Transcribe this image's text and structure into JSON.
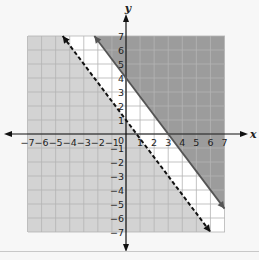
{
  "chart_data": {
    "type": "line",
    "title": "",
    "xlabel": "x",
    "ylabel": "y",
    "xlim": [
      -7,
      7
    ],
    "ylim": [
      -7,
      7
    ],
    "grid": true,
    "x_ticks": [
      -7,
      -6,
      -5,
      -4,
      -3,
      -2,
      -1,
      1,
      2,
      3,
      4,
      5,
      6,
      7
    ],
    "y_ticks": [
      7,
      6,
      5,
      4,
      3,
      2,
      1,
      -1,
      -2,
      -3,
      -4,
      -5,
      -6,
      -7
    ],
    "origin_label": "0",
    "series": [
      {
        "name": "solid boundary",
        "equation": "y = -4/3 x + 4",
        "style": "solid",
        "points": [
          [
            -2.25,
            7
          ],
          [
            7,
            -5.33
          ]
        ],
        "shading": "above",
        "fill_color": "#9c9c9c"
      },
      {
        "name": "dashed boundary",
        "equation": "y = -4/3 x + 1",
        "style": "dashed",
        "points": [
          [
            -4.5,
            7
          ],
          [
            6,
            -7
          ]
        ],
        "shading": "below",
        "fill_color": "#d3d3d3"
      }
    ],
    "colors": {
      "between_region": "#ffffff",
      "solid_line": "#555555",
      "dashed_line": "#111111",
      "grid_light": "#b4b4b4",
      "grid_dark": "#b0b0b0",
      "axis": "#111111"
    }
  }
}
